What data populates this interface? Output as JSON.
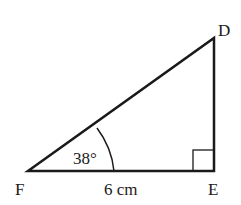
{
  "diagram": {
    "type": "right-triangle",
    "vertices": {
      "F": {
        "label": "F"
      },
      "E": {
        "label": "E"
      },
      "D": {
        "label": "D"
      }
    },
    "angle_label": "38°",
    "side_label": "6 cm",
    "right_angle_at": "E",
    "colors": {
      "stroke": "#1a1a1a",
      "background": "#ffffff"
    }
  }
}
